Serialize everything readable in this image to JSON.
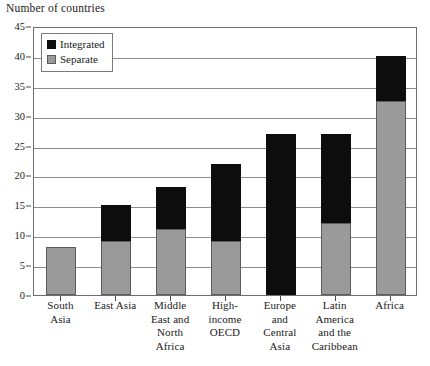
{
  "chart_data": {
    "type": "bar",
    "title": "Number of countries",
    "xlabel": "",
    "ylabel": "Number of countries",
    "ylim": [
      0,
      45
    ],
    "ytick_step": 5,
    "yticks": [
      0,
      5,
      10,
      15,
      20,
      25,
      30,
      35,
      40,
      45
    ],
    "grid": true,
    "stacked": true,
    "legend_position": "top-left",
    "categories": [
      "South Asia",
      "East Asia",
      "Middle East and North Africa",
      "High-income OECD",
      "Europe and Central Asia",
      "Latin America and the Caribbean",
      "Africa"
    ],
    "category_label_lines": [
      [
        "South",
        "Asia"
      ],
      [
        "East Asia"
      ],
      [
        "Middle",
        "East and",
        "North",
        "Africa"
      ],
      [
        "High-",
        "income",
        "OECD"
      ],
      [
        "Europe",
        "and",
        "Central",
        "Asia"
      ],
      [
        "Latin",
        "America",
        "and the",
        "Caribbean"
      ],
      [
        "Africa"
      ]
    ],
    "series": [
      {
        "name": "Separate",
        "color": "#9a9a9a",
        "values": [
          8,
          9,
          11,
          9,
          0,
          12,
          32.5
        ]
      },
      {
        "name": "Integrated",
        "color": "#0d0d0d",
        "values": [
          0,
          6,
          7,
          13,
          27,
          15,
          7.5
        ]
      }
    ],
    "totals": [
      8,
      15,
      18,
      22,
      27,
      27,
      40
    ]
  },
  "legend": {
    "items": [
      {
        "label": "Integrated",
        "swatch": "integrated"
      },
      {
        "label": "Separate",
        "swatch": "separate"
      }
    ]
  },
  "colors": {
    "separate": "#9a9a9a",
    "integrated": "#0d0d0d",
    "gridline": "#8d8d8d",
    "axis": "#6d6d6d",
    "text": "#1a1a1a",
    "background": "#ffffff"
  }
}
